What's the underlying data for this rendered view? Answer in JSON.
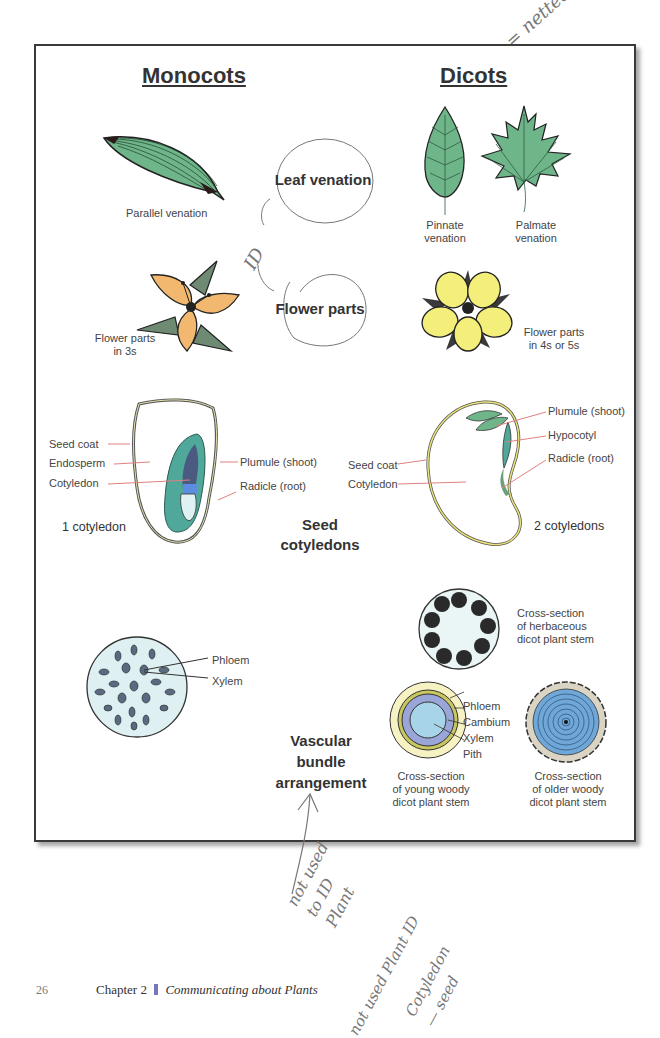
{
  "headings": {
    "monocots": "Monocots",
    "dicots": "Dicots"
  },
  "handwritten": {
    "netted": "= netted",
    "id": "ID",
    "not_used_to_id": [
      "not used",
      "to ID",
      "Plant"
    ],
    "not_used_plant_id": "not used Plant ID",
    "cotyledon_seed": [
      "Cotyledon",
      "— seed"
    ]
  },
  "categories": {
    "leaf_venation": "Leaf venation",
    "flower_parts": "Flower parts",
    "seed_cotyledons": [
      "Seed",
      "cotyledons"
    ],
    "vascular": [
      "Vascular",
      "bundle",
      "arrangement"
    ]
  },
  "monocot": {
    "leaf_label": "Parallel venation",
    "flower_label": [
      "Flower parts",
      "in 3s"
    ],
    "seed_labels": {
      "seed_coat": "Seed coat",
      "endosperm": "Endosperm",
      "cotyledon": "Cotyledon",
      "plumule": "Plumule (shoot)",
      "radicle": "Radicle (root)"
    },
    "seed_count": "1 cotyledon",
    "stem_labels": {
      "phloem": "Phloem",
      "xylem": "Xylem"
    }
  },
  "dicot": {
    "pinnate_label": [
      "Pinnate",
      "venation"
    ],
    "palmate_label": [
      "Palmate",
      "venation"
    ],
    "flower_label": [
      "Flower parts",
      "in 4s or 5s"
    ],
    "seed_labels": {
      "plumule": "Plumule (shoot)",
      "hypocotyl": "Hypocotyl",
      "radicle": "Radicle (root)",
      "seed_coat": "Seed coat",
      "cotyledon": "Cotyledon"
    },
    "seed_count": "2 cotyledons",
    "herbaceous_label": [
      "Cross-section",
      "of herbaceous",
      "dicot plant stem"
    ],
    "young_stem_labels": {
      "phloem": "Phloem",
      "cambium": "Cambium",
      "xylem": "Xylem",
      "pith": "Pith"
    },
    "young_label": [
      "Cross-section",
      "of young woody",
      "dicot plant stem"
    ],
    "older_label": [
      "Cross-section",
      "of older woody",
      "dicot plant stem"
    ]
  },
  "footer": {
    "page_number": "26",
    "chapter": "Chapter 2",
    "title": "Communicating about Plants"
  },
  "colors": {
    "leaf_green": "#6fb58a",
    "monocot_petal": "#f2b870",
    "dicot_petal": "#f4ee7a",
    "cotyledon_teal": "#4fa89a",
    "stem_blue": "#a8d4ea",
    "label_line": "#e08080"
  }
}
